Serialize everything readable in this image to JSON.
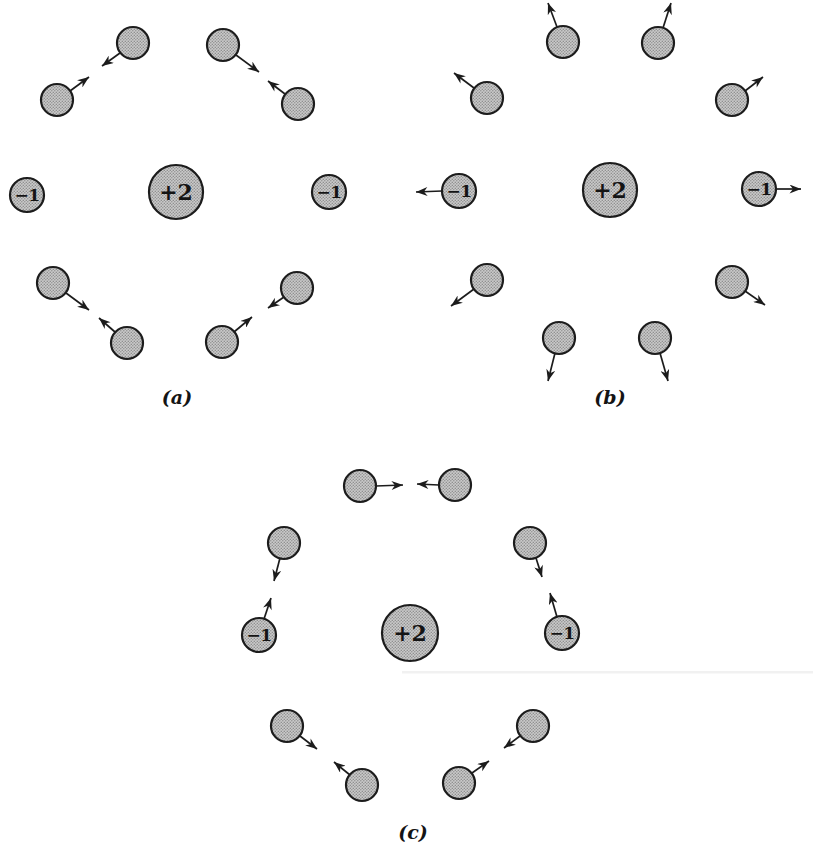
{
  "figure": {
    "panels": [
      {
        "label": "(a)",
        "central_charge": "+2",
        "left_charge": "−1",
        "right_charge": "−1"
      },
      {
        "label": "(b)",
        "central_charge": "+2",
        "left_charge": "−1",
        "right_charge": "−1"
      },
      {
        "label": "(c)",
        "central_charge": "+2",
        "left_charge": "−1",
        "right_charge": "−1"
      }
    ],
    "colors": {
      "circle_fill_base": "#cacaca",
      "circle_halftone_dot": "#8e8e8e",
      "outline": "#1c1c1c",
      "background": "#ffffff"
    }
  }
}
